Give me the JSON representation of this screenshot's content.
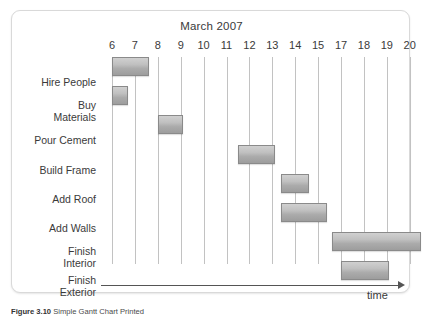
{
  "chart_data": {
    "type": "bar",
    "orientation": "horizontal",
    "subtype": "gantt",
    "title": "March 2007",
    "xlabel": "time",
    "ylabel": "",
    "grid": true,
    "legend": false,
    "x_tick_labels": [
      "6",
      "7",
      "8",
      "9",
      "10",
      "11",
      "12",
      "13",
      "14",
      "15",
      "17",
      "18",
      "19",
      "20"
    ],
    "categories": [
      "Hire People",
      "Buy Materials",
      "Pour Cement",
      "Build Frame",
      "Add Roof",
      "Add Walls",
      "Finish Interior",
      "Finish Exterior"
    ],
    "tasks": [
      {
        "name": "Hire People",
        "label": "Hire People",
        "start_day": 6,
        "end_day": 7.6,
        "start_tick_index": 0,
        "end_tick_index": 1.6
      },
      {
        "name": "Buy Materials",
        "label": "Buy\nMaterials",
        "start_day": 6,
        "end_day": 6.7,
        "start_tick_index": 0,
        "end_tick_index": 0.7
      },
      {
        "name": "Pour Cement",
        "label": "Pour Cement",
        "start_day": 8,
        "end_day": 9.1,
        "start_tick_index": 2,
        "end_tick_index": 3.1
      },
      {
        "name": "Build Frame",
        "label": "Build Frame",
        "start_day": 11.5,
        "end_day": 13.1,
        "start_tick_index": 5.5,
        "end_tick_index": 7.1
      },
      {
        "name": "Add Roof",
        "label": "Add Roof",
        "start_day": 13.4,
        "end_day": 14.6,
        "start_tick_index": 7.4,
        "end_tick_index": 8.6
      },
      {
        "name": "Add Walls",
        "label": "Add Walls",
        "start_day": 13.4,
        "end_day": 15.2,
        "start_tick_index": 7.4,
        "end_tick_index": 9.4
      },
      {
        "name": "Finish Interior",
        "label": "Finish\nInterior",
        "start_day": 15.4,
        "end_day": 19.6,
        "start_tick_index": 9.6,
        "end_tick_index": 13.5
      },
      {
        "name": "Finish Exterior",
        "label": "Finish\nExterior",
        "start_day": 15.7,
        "end_day": 18.1,
        "start_tick_index": 10.0,
        "end_tick_index": 12.1
      }
    ],
    "colors": {
      "bar_fill_top": "#d0d0d0",
      "bar_fill_bottom": "#9d9d9d",
      "bar_border": "#8a8a8a",
      "gridline": "#c2c2c2",
      "axis": "#555555",
      "text": "#3a3a3a",
      "card_border": "#d9d9d9",
      "background": "#ffffff"
    }
  },
  "caption": {
    "figure_number": "Figure 3.10",
    "text": "Simple Gantt Chart Printed"
  }
}
